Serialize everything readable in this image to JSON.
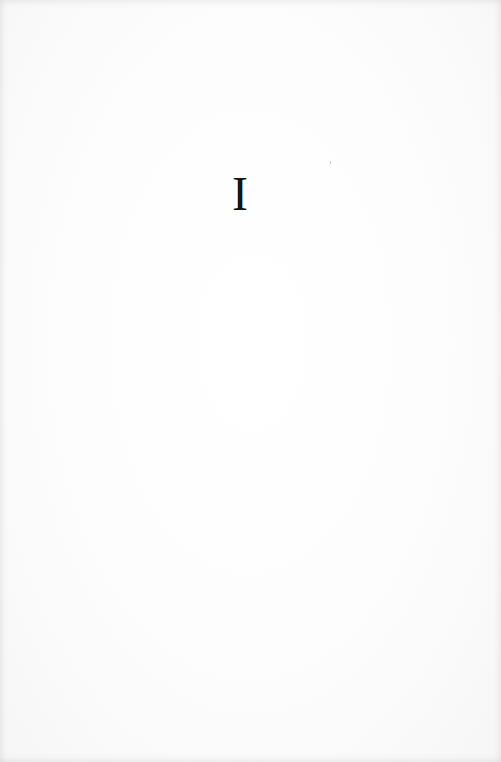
{
  "page": {
    "heading_numeral": "I"
  }
}
